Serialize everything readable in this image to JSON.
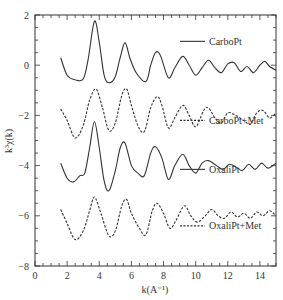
{
  "chart_data": {
    "type": "line",
    "title": "",
    "xlabel": "k(A⁻¹)",
    "ylabel": "k³χ(k)",
    "xlim": [
      0,
      15
    ],
    "ylim": [
      -8,
      2
    ],
    "xticks": [
      0,
      2,
      4,
      6,
      8,
      10,
      12,
      14
    ],
    "yticks": [
      2,
      0,
      -2,
      -4,
      -6,
      -8
    ],
    "xtick_labels": [
      "0",
      "2",
      "4",
      "6",
      "8",
      "10",
      "12",
      "14"
    ],
    "ytick_labels": [
      "2",
      "0",
      "−2",
      "−4",
      "−6",
      "−8"
    ],
    "grid": false,
    "legend_position": "inline-right",
    "series": [
      {
        "name": "CarboPt",
        "style": "solid",
        "legend_y": 0.95,
        "points": [
          [
            1.6,
            0.3
          ],
          [
            2.0,
            -0.4
          ],
          [
            2.5,
            -0.58
          ],
          [
            3.0,
            -0.55
          ],
          [
            3.3,
            0.2
          ],
          [
            3.7,
            1.75
          ],
          [
            4.0,
            0.9
          ],
          [
            4.3,
            -0.4
          ],
          [
            4.6,
            -0.7
          ],
          [
            5.0,
            -0.45
          ],
          [
            5.3,
            0.3
          ],
          [
            5.6,
            0.9
          ],
          [
            5.9,
            0.3
          ],
          [
            6.3,
            -0.3
          ],
          [
            6.9,
            -0.65
          ],
          [
            7.2,
            0.0
          ],
          [
            7.5,
            0.5
          ],
          [
            7.8,
            0.4
          ],
          [
            8.3,
            -0.5
          ],
          [
            8.7,
            -0.1
          ],
          [
            9.2,
            0.35
          ],
          [
            9.6,
            0.0
          ],
          [
            10.0,
            -0.4
          ],
          [
            10.4,
            -0.1
          ],
          [
            10.8,
            0.2
          ],
          [
            11.2,
            -0.1
          ],
          [
            11.6,
            -0.3
          ],
          [
            12.0,
            0.05
          ],
          [
            12.4,
            0.1
          ],
          [
            12.8,
            -0.25
          ],
          [
            13.2,
            -0.05
          ],
          [
            13.6,
            -0.3
          ],
          [
            14.0,
            0.0
          ],
          [
            14.3,
            0.15
          ],
          [
            14.6,
            -0.05
          ],
          [
            15.0,
            -0.2
          ]
        ]
      },
      {
        "name": "CarboPt+Met",
        "style": "dashed",
        "legend_y": -2.2,
        "points": [
          [
            1.6,
            -1.75
          ],
          [
            2.0,
            -2.2
          ],
          [
            2.5,
            -2.9
          ],
          [
            3.0,
            -2.4
          ],
          [
            3.4,
            -1.4
          ],
          [
            3.8,
            -0.95
          ],
          [
            4.2,
            -1.7
          ],
          [
            4.6,
            -2.6
          ],
          [
            5.0,
            -2.3
          ],
          [
            5.4,
            -1.2
          ],
          [
            5.7,
            -0.95
          ],
          [
            6.0,
            -1.6
          ],
          [
            6.4,
            -2.4
          ],
          [
            6.8,
            -2.65
          ],
          [
            7.2,
            -1.7
          ],
          [
            7.6,
            -1.25
          ],
          [
            7.9,
            -1.6
          ],
          [
            8.3,
            -2.5
          ],
          [
            8.7,
            -2.1
          ],
          [
            9.2,
            -1.6
          ],
          [
            9.6,
            -2.0
          ],
          [
            10.0,
            -2.45
          ],
          [
            10.5,
            -1.8
          ],
          [
            10.8,
            -1.7
          ],
          [
            11.2,
            -2.1
          ],
          [
            11.6,
            -2.3
          ],
          [
            12.0,
            -1.9
          ],
          [
            12.5,
            -2.0
          ],
          [
            13.0,
            -2.2
          ],
          [
            13.4,
            -2.35
          ],
          [
            13.8,
            -1.9
          ],
          [
            14.2,
            -1.8
          ],
          [
            14.6,
            -2.1
          ],
          [
            15.0,
            -1.9
          ]
        ]
      },
      {
        "name": "OxaliPt",
        "style": "solid",
        "legend_y": -4.15,
        "points": [
          [
            1.6,
            -3.9
          ],
          [
            2.0,
            -4.5
          ],
          [
            2.4,
            -4.65
          ],
          [
            2.8,
            -4.4
          ],
          [
            3.1,
            -4.3
          ],
          [
            3.4,
            -3.3
          ],
          [
            3.7,
            -2.25
          ],
          [
            4.0,
            -3.3
          ],
          [
            4.3,
            -4.6
          ],
          [
            4.6,
            -5.0
          ],
          [
            5.0,
            -4.2
          ],
          [
            5.3,
            -3.3
          ],
          [
            5.6,
            -3.1
          ],
          [
            6.0,
            -4.0
          ],
          [
            6.4,
            -4.3
          ],
          [
            6.8,
            -4.4
          ],
          [
            7.2,
            -3.5
          ],
          [
            7.5,
            -3.25
          ],
          [
            7.9,
            -3.7
          ],
          [
            8.3,
            -4.55
          ],
          [
            8.7,
            -4.0
          ],
          [
            9.2,
            -3.55
          ],
          [
            9.6,
            -4.0
          ],
          [
            10.0,
            -4.3
          ],
          [
            10.4,
            -3.9
          ],
          [
            10.8,
            -3.8
          ],
          [
            11.3,
            -4.0
          ],
          [
            11.7,
            -4.15
          ],
          [
            12.1,
            -3.95
          ],
          [
            12.5,
            -4.05
          ],
          [
            12.9,
            -4.2
          ],
          [
            13.3,
            -3.95
          ],
          [
            13.7,
            -4.15
          ],
          [
            14.1,
            -3.9
          ],
          [
            14.5,
            -4.1
          ],
          [
            15.0,
            -3.9
          ]
        ]
      },
      {
        "name": "OxaliPt+Met",
        "style": "dashed",
        "legend_y": -6.4,
        "points": [
          [
            1.6,
            -5.75
          ],
          [
            2.0,
            -6.3
          ],
          [
            2.5,
            -6.95
          ],
          [
            3.0,
            -6.6
          ],
          [
            3.4,
            -5.8
          ],
          [
            3.7,
            -5.25
          ],
          [
            4.1,
            -5.9
          ],
          [
            4.6,
            -6.8
          ],
          [
            5.0,
            -6.6
          ],
          [
            5.4,
            -5.6
          ],
          [
            5.7,
            -5.35
          ],
          [
            6.0,
            -5.9
          ],
          [
            6.5,
            -6.5
          ],
          [
            6.9,
            -6.75
          ],
          [
            7.3,
            -5.8
          ],
          [
            7.6,
            -5.5
          ],
          [
            8.0,
            -5.9
          ],
          [
            8.4,
            -6.5
          ],
          [
            8.8,
            -6.15
          ],
          [
            9.3,
            -5.6
          ],
          [
            9.7,
            -6.0
          ],
          [
            10.1,
            -6.25
          ],
          [
            10.6,
            -6.0
          ],
          [
            11.0,
            -5.75
          ],
          [
            11.4,
            -6.0
          ],
          [
            11.8,
            -6.1
          ],
          [
            12.2,
            -5.85
          ],
          [
            12.6,
            -6.05
          ],
          [
            13.0,
            -5.9
          ],
          [
            13.4,
            -6.1
          ],
          [
            13.8,
            -5.85
          ],
          [
            14.2,
            -6.0
          ],
          [
            14.6,
            -5.8
          ],
          [
            15.0,
            -6.0
          ]
        ]
      }
    ]
  },
  "colors": {
    "line": "#333333",
    "axis": "#333333",
    "background": "#ffffff"
  }
}
